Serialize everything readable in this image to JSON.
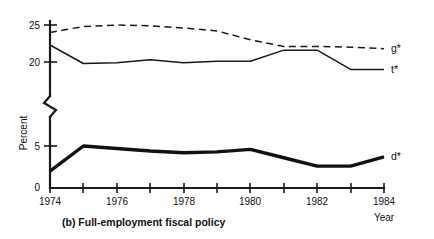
{
  "chart_data": {
    "type": "line",
    "title": "",
    "caption": "(b) Full-employment fiscal policy",
    "xlabel": "Year",
    "ylabel": "Percent",
    "grid": false,
    "legend_position": "right-inline",
    "axis_break": true,
    "axis_break_note": "y-axis broken between 5 and 20",
    "x": [
      1974,
      1975,
      1976,
      1977,
      1978,
      1979,
      1980,
      1981,
      1982,
      1983,
      1984
    ],
    "xticklabels": [
      "1974",
      "",
      "1976",
      "",
      "1978",
      "",
      "1980",
      "",
      "1982",
      "",
      "1984"
    ],
    "xticks_all": [
      "1974",
      "1975",
      "1976",
      "1977",
      "1978",
      "1979",
      "1980",
      "1981",
      "1982",
      "1983",
      "1984"
    ],
    "yticklabels": [
      "0",
      "5",
      "20",
      "25"
    ],
    "yticks": [
      0,
      5,
      20,
      25
    ],
    "ylim_lower": [
      0,
      6
    ],
    "ylim_upper": [
      19,
      25.6
    ],
    "series": [
      {
        "name": "g*",
        "label": "g*",
        "style": "dashed",
        "width": "thin",
        "color": "#1a1a1a",
        "values": [
          24.0,
          24.8,
          25.0,
          24.9,
          24.6,
          24.2,
          23.0,
          22.1,
          22.1,
          22.0,
          21.8
        ]
      },
      {
        "name": "t*",
        "label": "t*",
        "style": "solid",
        "width": "thin",
        "color": "#1a1a1a",
        "values": [
          22.3,
          19.8,
          19.9,
          20.3,
          19.9,
          20.1,
          20.1,
          21.6,
          21.6,
          19.0,
          19.0
        ]
      },
      {
        "name": "d*",
        "label": "d*",
        "style": "solid",
        "width": "thick",
        "color": "#111111",
        "values": [
          2.0,
          5.0,
          4.7,
          4.4,
          4.2,
          4.3,
          4.6,
          3.6,
          2.6,
          2.6,
          3.7
        ]
      }
    ]
  },
  "labels": {
    "y_axis_title": "Percent",
    "x_axis_title": "Year",
    "caption": "(b) Full-employment fiscal policy",
    "series_g": "g*",
    "series_t": "t*",
    "series_d": "d*",
    "ytick_0": "0",
    "ytick_5": "5",
    "ytick_20": "20",
    "ytick_25": "25",
    "xtick_1974": "1974",
    "xtick_1976": "1976",
    "xtick_1978": "1978",
    "xtick_1980": "1980",
    "xtick_1982": "1982",
    "xtick_1984": "1984"
  }
}
